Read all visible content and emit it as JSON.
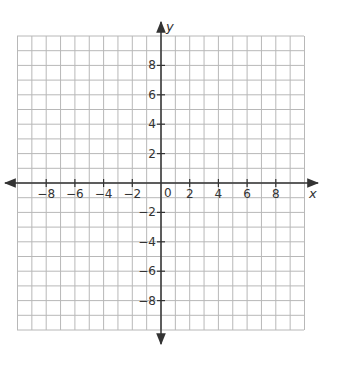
{
  "chart_data": {
    "type": "coordinate_grid",
    "title": "",
    "xlabel": "x",
    "ylabel": "y",
    "xlim": [
      -10,
      10
    ],
    "ylim": [
      -10,
      10
    ],
    "grid": true,
    "grid_step": 1,
    "x_tick_labels": [
      "-8",
      "-6",
      "-4",
      "-2",
      "2",
      "4",
      "6",
      "8"
    ],
    "x_tick_values": [
      -8,
      -6,
      -4,
      -2,
      2,
      4,
      6,
      8
    ],
    "y_tick_labels": [
      "8",
      "6",
      "4",
      "2",
      "-2",
      "-4",
      "-6",
      "-8"
    ],
    "y_tick_values": [
      8,
      6,
      4,
      2,
      -2,
      -4,
      -6,
      -8
    ],
    "origin_label": "0",
    "series": [],
    "legend": null
  },
  "colors": {
    "grid": "#b8b8b8",
    "axis": "#333333",
    "text": "#333333"
  }
}
